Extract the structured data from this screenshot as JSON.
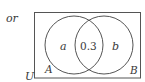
{
  "diagram": {
    "type": "venn",
    "prefix_label": "or",
    "universe_label": "U",
    "sets": [
      {
        "name": "A",
        "region_label": "a"
      },
      {
        "name": "B",
        "region_label": "b"
      }
    ],
    "intersection_value": "0.3",
    "colors": {
      "stroke": "#555555",
      "text": "#3a3a3a",
      "background": "#ffffff"
    }
  }
}
